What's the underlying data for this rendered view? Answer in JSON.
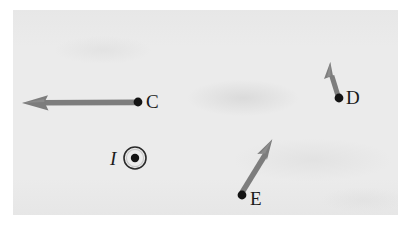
{
  "figure": {
    "kind": "physics-vector-diagram",
    "background_color": "#ebebeb",
    "page_color": "#ffffff",
    "ink_color": "#1a1a1a",
    "arrow_color": "#7a7a7a"
  },
  "current_source": {
    "symbol_name": "current-out-of-page",
    "label": "I",
    "center": {
      "x": 135,
      "y": 158
    },
    "outer_radius": 11,
    "inner_dot_radius": 4.2
  },
  "points": [
    {
      "id": "C",
      "label": "C",
      "dot": {
        "x": 138,
        "y": 102
      },
      "dot_radius": 4.4,
      "label_pos": {
        "x": 146,
        "y": 92
      },
      "arrow": {
        "name": "vector-arrow-C",
        "from": {
          "x": 138,
          "y": 102
        },
        "to": {
          "x": 22,
          "y": 103
        },
        "direction_deg": 180,
        "length_px": 116,
        "shaft_width": 5.4
      }
    },
    {
      "id": "D",
      "label": "D",
      "dot": {
        "x": 339,
        "y": 98
      },
      "dot_radius": 4.4,
      "label_pos": {
        "x": 346,
        "y": 88
      },
      "arrow": {
        "name": "vector-arrow-D",
        "from": {
          "x": 339,
          "y": 98
        },
        "to": {
          "x": 330,
          "y": 62
        },
        "direction_deg": 104,
        "length_px": 37,
        "shaft_width": 5.0
      }
    },
    {
      "id": "E",
      "label": "E",
      "dot": {
        "x": 242,
        "y": 195
      },
      "dot_radius": 4.4,
      "label_pos": {
        "x": 250,
        "y": 189
      },
      "arrow": {
        "name": "vector-arrow-E",
        "from": {
          "x": 242,
          "y": 195
        },
        "to": {
          "x": 272,
          "y": 139
        },
        "direction_deg": 62,
        "length_px": 63,
        "shaft_width": 5.4
      }
    }
  ]
}
